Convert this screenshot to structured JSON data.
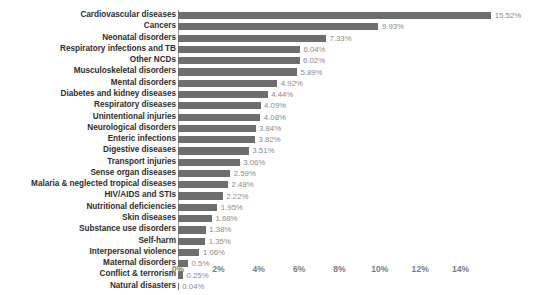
{
  "chart_data": {
    "type": "bar",
    "orientation": "horizontal",
    "title": "",
    "subtitle": "",
    "xlabel": "",
    "ylabel": "",
    "grid": false,
    "legend": null,
    "xlim": [
      0,
      15.9
    ],
    "xticks": [
      0,
      2,
      4,
      6,
      8,
      10,
      12,
      14
    ],
    "xtick_labels": [
      "0%",
      "2%",
      "4%",
      "6%",
      "8%",
      "10%",
      "12%",
      "14%"
    ],
    "value_suffix": "%",
    "bar_color": "#6e6e6e",
    "label_color": "#2e2e2e",
    "value_label_color": "#8c8c8c",
    "axis_color": "#9a9a9a",
    "background": "#ffffff",
    "categories": [
      "Cardiovascular diseases",
      "Cancers",
      "Neonatal disorders",
      "Respiratory infections and TB",
      "Other NCDs",
      "Musculoskeletal disorders",
      "Mental disorders",
      "Diabetes and kidney diseases",
      "Respiratory diseases",
      "Unintentional injuries",
      "Neurological disorders",
      "Enteric infections",
      "Digestive diseases",
      "Transport injuries",
      "Sense organ diseases",
      "Malaria & neglected tropical diseases",
      "HIV/AIDS and STIs",
      "Nutritional deficiencies",
      "Skin diseases",
      "Substance use disorders",
      "Self-harm",
      "Interpersonal violence",
      "Maternal disorders",
      "Conflict & terrorism",
      "Natural disasters"
    ],
    "values": [
      15.52,
      9.93,
      7.33,
      6.04,
      6.02,
      5.89,
      4.92,
      4.44,
      4.09,
      4.08,
      3.84,
      3.82,
      3.51,
      3.06,
      2.59,
      2.48,
      2.22,
      1.95,
      1.68,
      1.38,
      1.35,
      1.06,
      0.5,
      0.25,
      0.04
    ],
    "value_labels": [
      "15.52%",
      "9.93%",
      "7.33%",
      "6.04%",
      "6.02%",
      "5.89%",
      "4.92%",
      "4.44%",
      "4.09%",
      "4.08%",
      "3.84%",
      "3.82%",
      "3.51%",
      "3.06%",
      "2.59%",
      "2.48%",
      "2.22%",
      "1.95%",
      "1.68%",
      "1.38%",
      "1.35%",
      "1.06%",
      "0.5%",
      "0.25%",
      "0.04%"
    ]
  }
}
